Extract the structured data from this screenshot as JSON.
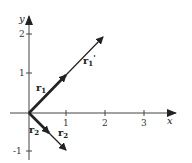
{
  "diagram": {
    "axes": {
      "x_label": "x",
      "y_label": "y",
      "x_ticks": [
        "1",
        "2",
        "3"
      ],
      "y_ticks": [
        "2",
        "1",
        "-1"
      ]
    },
    "vectors": [
      {
        "name": "r1",
        "label": "r",
        "subscript": "1",
        "from": [
          0,
          0
        ],
        "to": [
          1,
          1
        ],
        "style": "bold"
      },
      {
        "name": "r1_prime",
        "label": "r",
        "subscript": "1",
        "prime": "'",
        "from": [
          0,
          0
        ],
        "to": [
          1.9,
          1.95
        ],
        "style": "thin"
      },
      {
        "name": "r2",
        "label": "r",
        "subscript": "2",
        "from": [
          0,
          0
        ],
        "to": [
          0.55,
          -0.55
        ],
        "style": "bold"
      },
      {
        "name": "r2_prime",
        "label": "r",
        "subscript": "2",
        "prime": "'",
        "from": [
          0,
          0
        ],
        "to": [
          1,
          -1
        ],
        "style": "thin"
      }
    ],
    "colors": {
      "ink": "#222222",
      "background": "#ffffff"
    }
  }
}
